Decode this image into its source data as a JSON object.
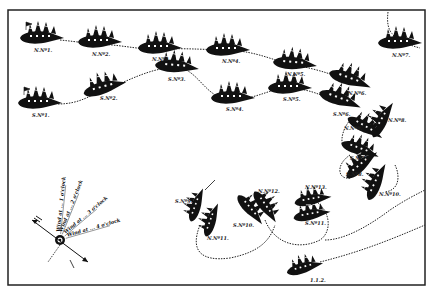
{
  "diagram": {
    "type": "naval-battle-plan",
    "colors": {
      "ink": "#111111",
      "paper": "#ffffff",
      "frame": "#222222"
    },
    "frame": {
      "x": 8,
      "y": 10,
      "w": 417,
      "h": 275
    },
    "ships": [
      {
        "id": "N1",
        "label": "N.Nº1.",
        "x": 42,
        "y": 38,
        "rot": 0,
        "flag": true
      },
      {
        "id": "N2",
        "label": "N.Nº2.",
        "x": 100,
        "y": 42,
        "rot": 0
      },
      {
        "id": "N3",
        "label": "N.Nº3.",
        "x": 160,
        "y": 48,
        "rot": 0
      },
      {
        "id": "N4",
        "label": "N.Nº4.",
        "x": 228,
        "y": 50,
        "rot": 0
      },
      {
        "id": "N5",
        "label": "N.Nº5.",
        "x": 295,
        "y": 64,
        "rot": 5
      },
      {
        "id": "N6",
        "label": "N.Nº6.",
        "x": 350,
        "y": 80,
        "rot": 20
      },
      {
        "id": "N7",
        "label": "N.Nº7.",
        "x": 400,
        "y": 43,
        "rot": 0
      },
      {
        "id": "S1",
        "label": "S.Nº1.",
        "x": 40,
        "y": 103,
        "rot": 0,
        "flag": true
      },
      {
        "id": "S2",
        "label": "S.Nº2.",
        "x": 105,
        "y": 88,
        "rot": -15
      },
      {
        "id": "S3",
        "label": "S.Nº3.",
        "x": 177,
        "y": 67,
        "rot": 5
      },
      {
        "id": "S4",
        "label": "S.Nº4.",
        "x": 233,
        "y": 98,
        "rot": 0
      },
      {
        "id": "S5",
        "label": "S.Nº5.",
        "x": 290,
        "y": 88,
        "rot": 0
      },
      {
        "id": "S6",
        "label": "S.Nº6.",
        "x": 340,
        "y": 100,
        "rot": 20
      },
      {
        "id": "N8",
        "label": "N.Nº8.",
        "x": 383,
        "y": 120,
        "rot": -60
      },
      {
        "id": "N9",
        "label": "N.Nº9.",
        "x": 365,
        "y": 128,
        "rot": 30
      },
      {
        "id": "S7",
        "label": "S.Nº7.",
        "x": 360,
        "y": 150,
        "rot": 20
      },
      {
        "id": "S8",
        "label": "S.Nº8.",
        "x": 362,
        "y": 165,
        "rot": -40
      },
      {
        "id": "N10",
        "label": "N.Nº10.",
        "x": 377,
        "y": 182,
        "rot": -65
      },
      {
        "id": "S9",
        "label": "S.Nº9.",
        "x": 197,
        "y": 205,
        "rot": -70
      },
      {
        "id": "N11",
        "label": "N.Nº11.",
        "x": 212,
        "y": 220,
        "rot": -70
      },
      {
        "id": "S10",
        "label": "S.Nº10.",
        "x": 250,
        "y": 210,
        "rot": 50
      },
      {
        "id": "N12",
        "label": "N.Nº12.",
        "x": 265,
        "y": 207,
        "rot": 55
      },
      {
        "id": "N13",
        "label": "N.Nº13.",
        "x": 313,
        "y": 200,
        "rot": -10
      },
      {
        "id": "S11",
        "label": "S.Nº11.",
        "x": 312,
        "y": 215,
        "rot": -10
      },
      {
        "id": "T1",
        "label": "1.1.2.",
        "x": 305,
        "y": 268,
        "rot": -15
      }
    ],
    "compass": {
      "center": {
        "x": 60,
        "y": 240
      },
      "wind_labels": [
        "Wind at ... 1 o'clock",
        "Wind at ... 2 o'clock",
        "Wind at ... 3 o'clock",
        "Wind at ... 4 o'clock"
      ]
    }
  }
}
